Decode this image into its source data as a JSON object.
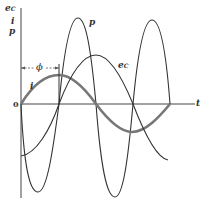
{
  "diagram": {
    "type": "waveform",
    "y_axis_labels": [
      "e",
      "C",
      "i",
      "p"
    ],
    "x_axis_label": "t",
    "origin_label": "0",
    "phase_label": "ϕ",
    "curves": [
      {
        "name": "p",
        "label": "p",
        "description": "instantaneous power, double frequency",
        "color": "#333333",
        "width": 1.1
      },
      {
        "name": "i",
        "label": "i",
        "description": "current, leads voltage by phi",
        "color": "#777777",
        "width": 2.6
      },
      {
        "name": "e_C",
        "label": "e",
        "label_sub": "C",
        "description": "capacitor voltage",
        "color": "#333333",
        "width": 1.1
      }
    ]
  }
}
